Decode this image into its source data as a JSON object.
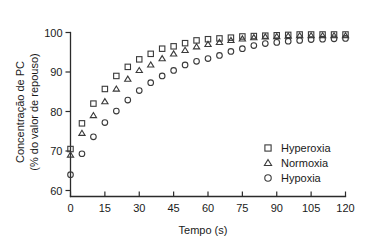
{
  "chart_data": {
    "type": "scatter",
    "title": "",
    "xlabel": "Tempo (s)",
    "ylabel": "Concentração de PC\n(% do valor de repouso)",
    "ylabel_line1": "Concentração de PC",
    "ylabel_line2": "(% do valor de repouso)",
    "xlim": [
      0,
      120
    ],
    "ylim": [
      60,
      100
    ],
    "xticks": [
      0,
      15,
      30,
      45,
      60,
      75,
      90,
      105,
      120
    ],
    "yticks": [
      60,
      70,
      80,
      90,
      100
    ],
    "xticklabels": [
      "0",
      "15",
      "30",
      "45",
      "60",
      "75",
      "90",
      "105",
      "120"
    ],
    "yticklabels": [
      "60",
      "70",
      "80",
      "90",
      "100"
    ],
    "grid": false,
    "legend_position": "lower-right",
    "x": [
      0,
      5,
      10,
      15,
      20,
      25,
      30,
      35,
      40,
      45,
      50,
      55,
      60,
      65,
      70,
      75,
      80,
      85,
      90,
      95,
      100,
      105,
      110,
      115,
      120
    ],
    "series": [
      {
        "name": "Hyperoxia",
        "marker": "square",
        "color": "#3a3a3a",
        "values": [
          70.5,
          77.0,
          82.0,
          85.7,
          89.0,
          91.3,
          93.2,
          94.6,
          95.9,
          96.5,
          97.3,
          98.0,
          98.3,
          98.5,
          98.7,
          99.0,
          99.1,
          99.2,
          99.3,
          99.4,
          99.5,
          99.5,
          99.5,
          99.5,
          99.5
        ]
      },
      {
        "name": "Normoxia",
        "marker": "triangle",
        "color": "#3a3a3a",
        "values": [
          69.0,
          74.5,
          79.0,
          82.5,
          85.7,
          88.2,
          90.4,
          91.8,
          93.4,
          94.6,
          95.5,
          96.4,
          97.0,
          97.5,
          98.0,
          98.4,
          98.7,
          98.9,
          99.0,
          99.1,
          99.2,
          99.2,
          99.2,
          99.2,
          99.2
        ]
      },
      {
        "name": "Hypoxia",
        "marker": "circle",
        "color": "#3a3a3a",
        "values": [
          64.0,
          69.3,
          73.6,
          77.2,
          80.1,
          82.9,
          85.3,
          87.3,
          89.0,
          90.4,
          91.8,
          92.7,
          93.4,
          94.2,
          95.2,
          95.9,
          96.7,
          97.2,
          97.5,
          97.8,
          98.0,
          98.2,
          98.3,
          98.4,
          98.5
        ]
      }
    ],
    "legend": [
      {
        "label": "Hyperoxia",
        "marker": "square"
      },
      {
        "label": "Normoxia",
        "marker": "triangle"
      },
      {
        "label": "Hypoxia",
        "marker": "circle"
      }
    ]
  }
}
